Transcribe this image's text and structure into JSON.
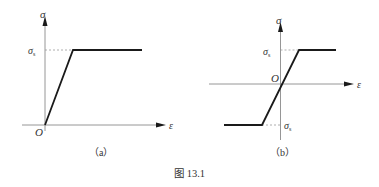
{
  "figure": {
    "caption": "图 13.1",
    "panels": [
      {
        "id": "a",
        "label": "（a）",
        "x_axis_label": "ε",
        "y_axis_label": "σ",
        "origin_label": "O",
        "yield_label": "σ",
        "yield_subscript": "s",
        "description": "Elastic–perfectly plastic stress–strain curve (tension only)"
      },
      {
        "id": "b",
        "label": "（b）",
        "x_axis_label": "ε",
        "y_axis_label": "σ",
        "origin_label": "O",
        "yield_label_top": "σ",
        "yield_subscript_top": "s",
        "yield_label_bottom": "σ",
        "yield_subscript_bottom": "s",
        "description": "Elastic–perfectly plastic stress–strain curve (tension and compression)"
      }
    ],
    "colors": {
      "curve": "#1a1a1a",
      "axis": "#8a8a8a",
      "dash": "#9a9a9a",
      "text": "#333333"
    }
  }
}
